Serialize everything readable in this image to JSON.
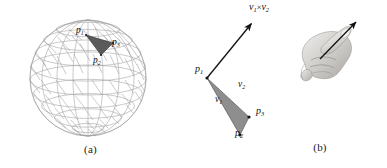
{
  "figure": {
    "background_color": "#ffffff",
    "width": 387,
    "height": 168,
    "wireframe_color": "#9a9a9a",
    "triangle_fill_a": "#585858",
    "triangle_fill_b": "#8d8d8d",
    "triangle_stroke_b": "#555555",
    "arrow_color": "#141414"
  },
  "panel_a": {
    "caption": "(a)",
    "description": "wireframe sphere mesh with one highlighted dark triangle",
    "labels": {
      "p1": {
        "base": "p",
        "sub": "1"
      },
      "p2": {
        "base": "p",
        "sub": "2"
      },
      "p3": {
        "base": "p",
        "sub": "3"
      }
    },
    "sphere": {
      "center_x": 88,
      "center_y": 78,
      "radius": 58,
      "latitude_bands": 9,
      "longitude_bands": 16
    },
    "highlight_triangle": {
      "p1": [
        86,
        35
      ],
      "p2": [
        101,
        55
      ],
      "p3": [
        112,
        43
      ]
    }
  },
  "panel_b": {
    "caption": "(b)",
    "description": "triangle p1 p2 p3 with edge vectors v1 and v2 and the cross product normal arrow, plus a right-hand rule photograph",
    "labels": {
      "cross_product": {
        "left": "v",
        "left_sub": "1",
        "operator": "×",
        "right": "v",
        "right_sub": "2"
      },
      "p1": {
        "base": "p",
        "sub": "1"
      },
      "p2": {
        "base": "p",
        "sub": "2"
      },
      "p3": {
        "base": "p",
        "sub": "3"
      },
      "v1": {
        "base": "v",
        "sub": "1"
      },
      "v2": {
        "base": "v",
        "sub": "2"
      }
    },
    "triangle": {
      "p1": [
        14,
        78
      ],
      "p2": [
        47,
        135
      ],
      "p3": [
        56,
        117
      ]
    },
    "normal_arrow": {
      "from": [
        14,
        78
      ],
      "to": [
        60,
        22
      ]
    },
    "hand_image": {
      "alt": "right hand with thumb extended demonstrating the right-hand rule",
      "arrow_from": [
        128,
        60
      ],
      "arrow_to": [
        152,
        22
      ]
    }
  }
}
